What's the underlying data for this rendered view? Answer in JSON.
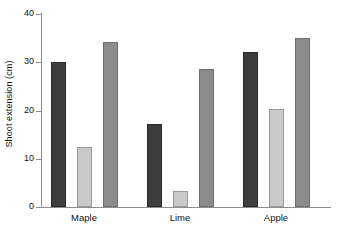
{
  "chart_data": {
    "type": "bar",
    "title": "",
    "xlabel": "",
    "ylabel": "Shoot extension (cm)",
    "categories": [
      "Maple",
      "Lime",
      "Apple"
    ],
    "series": [
      {
        "name": "series-1",
        "color": "#3d3d3d",
        "values": [
          30.1,
          17.3,
          32.1
        ]
      },
      {
        "name": "series-2",
        "color": "#c9c9c9",
        "values": [
          12.4,
          3.3,
          20.3
        ]
      },
      {
        "name": "series-3",
        "color": "#8b8b8b",
        "values": [
          34.2,
          28.6,
          35.1
        ]
      }
    ],
    "ylim": [
      0,
      40
    ],
    "yticks": [
      0,
      10,
      20,
      30,
      40
    ],
    "ytick_labels": [
      "0",
      "10",
      "20",
      "30",
      "40"
    ],
    "grid": false,
    "legend": "none"
  },
  "axes": {
    "y_title": "Shoot extension (cm)",
    "y_labels": [
      "40",
      "30",
      "20",
      "10",
      "0"
    ]
  },
  "categories": {
    "maple": "Maple",
    "lime": "Lime",
    "apple": "Apple"
  },
  "colors": {
    "series_1": "#3d3d3d",
    "series_2": "#c9c9c9",
    "series_3": "#8b8b8b",
    "axis": "#8d8d8d",
    "text": "#111111",
    "background": "#ffffff"
  }
}
